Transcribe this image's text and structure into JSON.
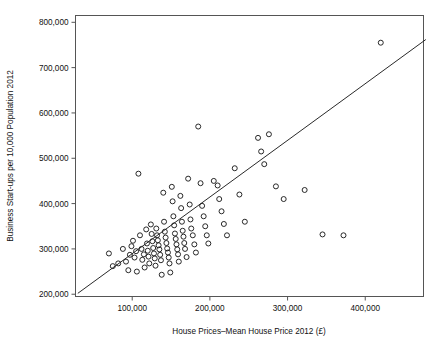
{
  "figure": {
    "background_color": "#ffffff",
    "frame_color": "#555555",
    "marker_color": "#1d1d1d",
    "line_color": "#1d1d1d",
    "clipped_title": ""
  },
  "chart_data": {
    "type": "scatter",
    "title": "",
    "xlabel": "House Prices–Mean House Price 2012 (£)",
    "ylabel": "Business Start-ups per 10,000 Population 2012",
    "xlim": [
      27000,
      475000
    ],
    "ylim": [
      195000,
      815000
    ],
    "xticks": [
      100000,
      200000,
      300000,
      400000
    ],
    "xticklabels": [
      "100,000",
      "200,000",
      "300,000",
      "400,000"
    ],
    "yticks": [
      200000,
      300000,
      400000,
      500000,
      600000,
      700000,
      800000
    ],
    "yticklabels": [
      "200,000",
      "300,000",
      "400,000",
      "500,000",
      "600,000",
      "700,000",
      "800,000"
    ],
    "grid": false,
    "legend": null,
    "marker": "open-circle",
    "marker_size": 4.4,
    "series": [
      {
        "name": "Local authorities",
        "points": [
          [
            70000,
            290000
          ],
          [
            75000,
            262000
          ],
          [
            82000,
            268000
          ],
          [
            88000,
            300000
          ],
          [
            92000,
            272000
          ],
          [
            95000,
            253000
          ],
          [
            97000,
            287000
          ],
          [
            99000,
            306000
          ],
          [
            101000,
            318000
          ],
          [
            103000,
            281000
          ],
          [
            105000,
            295000
          ],
          [
            106000,
            250000
          ],
          [
            108000,
            466000
          ],
          [
            110000,
            330000
          ],
          [
            112000,
            300000
          ],
          [
            113000,
            276000
          ],
          [
            115000,
            288000
          ],
          [
            116000,
            259000
          ],
          [
            118000,
            343000
          ],
          [
            119000,
            312000
          ],
          [
            120000,
            296000
          ],
          [
            121000,
            283000
          ],
          [
            122000,
            268000
          ],
          [
            124000,
            354000
          ],
          [
            125000,
            333000
          ],
          [
            126000,
            317000
          ],
          [
            127000,
            302000
          ],
          [
            128000,
            290000
          ],
          [
            129000,
            279000
          ],
          [
            130000,
            263000
          ],
          [
            131000,
            345000
          ],
          [
            132000,
            330000
          ],
          [
            133000,
            319000
          ],
          [
            134000,
            308000
          ],
          [
            135000,
            299000
          ],
          [
            136000,
            287000
          ],
          [
            137000,
            275000
          ],
          [
            138000,
            243000
          ],
          [
            140000,
            424000
          ],
          [
            141000,
            360000
          ],
          [
            142000,
            338000
          ],
          [
            143000,
            325000
          ],
          [
            144000,
            313000
          ],
          [
            145000,
            301000
          ],
          [
            146000,
            292000
          ],
          [
            147000,
            281000
          ],
          [
            148000,
            268000
          ],
          [
            149000,
            248000
          ],
          [
            151000,
            437000
          ],
          [
            152000,
            405000
          ],
          [
            153000,
            372000
          ],
          [
            154000,
            352000
          ],
          [
            155000,
            334000
          ],
          [
            156000,
            322000
          ],
          [
            157000,
            310000
          ],
          [
            158000,
            299000
          ],
          [
            159000,
            288000
          ],
          [
            160000,
            272000
          ],
          [
            162000,
            417000
          ],
          [
            163000,
            390000
          ],
          [
            164000,
            360000
          ],
          [
            165000,
            340000
          ],
          [
            166000,
            327000
          ],
          [
            167000,
            313000
          ],
          [
            168000,
            300000
          ],
          [
            170000,
            282000
          ],
          [
            172000,
            455000
          ],
          [
            174000,
            398000
          ],
          [
            175000,
            365000
          ],
          [
            176000,
            345000
          ],
          [
            178000,
            330000
          ],
          [
            180000,
            310000
          ],
          [
            182000,
            292000
          ],
          [
            185000,
            570000
          ],
          [
            188000,
            445000
          ],
          [
            190000,
            395000
          ],
          [
            192000,
            372000
          ],
          [
            194000,
            350000
          ],
          [
            196000,
            330000
          ],
          [
            198000,
            312000
          ],
          [
            205000,
            450000
          ],
          [
            210000,
            440000
          ],
          [
            212000,
            410000
          ],
          [
            215000,
            383000
          ],
          [
            218000,
            355000
          ],
          [
            222000,
            330000
          ],
          [
            232000,
            478000
          ],
          [
            238000,
            420000
          ],
          [
            245000,
            360000
          ],
          [
            262000,
            545000
          ],
          [
            266000,
            515000
          ],
          [
            270000,
            487000
          ],
          [
            276000,
            553000
          ],
          [
            285000,
            438000
          ],
          [
            295000,
            410000
          ],
          [
            322000,
            430000
          ],
          [
            345000,
            332000
          ],
          [
            372000,
            330000
          ],
          [
            420000,
            755000
          ]
        ]
      }
    ],
    "fit_line": {
      "name": "linear fit",
      "x_start": 30000,
      "y_start": 202000,
      "x_end": 478000,
      "y_end": 762000
    }
  },
  "axes": {
    "x_axis_name": "x-axis",
    "y_axis_name": "y-axis"
  }
}
